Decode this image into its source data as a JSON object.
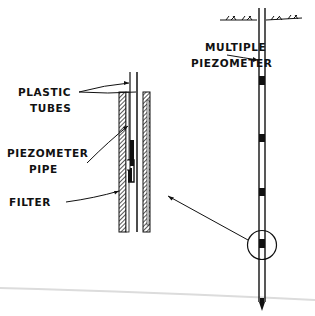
{
  "diagram": {
    "type": "engineering-schematic",
    "labels": {
      "multiple_piezometer_line1": "MULTIPLE",
      "multiple_piezometer_line2": "PIEZOMETER",
      "plastic_tubes_line1": "PLASTIC",
      "plastic_tubes_line2": "TUBES",
      "piezometer_pipe_line1": "PIEZOMETER",
      "piezometer_pipe_line2": "PIPE",
      "filter": "FILTER"
    },
    "main_pipe": {
      "marker_count": 4,
      "ground_surface": true,
      "detail_circle_on_marker": 4
    },
    "colors": {
      "ink": "#111111",
      "background": "#ffffff",
      "scan_line": "#d8d8d8"
    }
  }
}
